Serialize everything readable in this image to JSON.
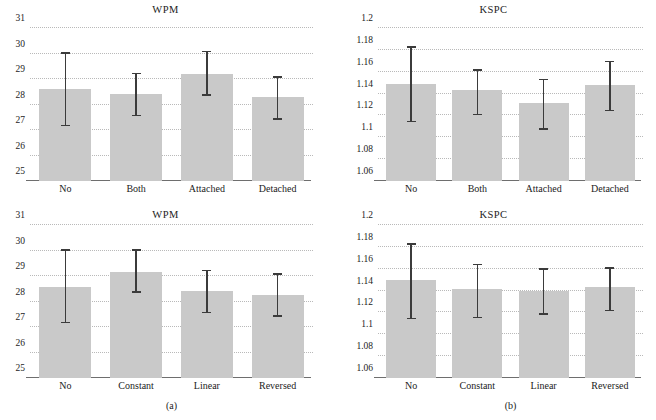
{
  "figure": {
    "background": "#ffffff",
    "bar_color": "#c9c9c9",
    "error_color": "#3b3b3b",
    "grid_color": "#b9b9b9",
    "axis_color": "#6e6e6e",
    "subcaptions": {
      "left": "(a)",
      "right": "(b)"
    }
  },
  "chart_data": [
    {
      "id": "wpm-top",
      "type": "bar",
      "title": "WPM",
      "xlabel": "",
      "ylabel": "",
      "categories": [
        "No",
        "Both",
        "Attached",
        "Detached"
      ],
      "values": [
        28.6,
        28.4,
        29.2,
        28.3
      ],
      "error_low": [
        27.15,
        27.55,
        28.35,
        27.4
      ],
      "error_high": [
        30.0,
        29.2,
        30.05,
        29.05
      ],
      "ylim": [
        25,
        31
      ],
      "yticks": [
        "25",
        "26",
        "27",
        "28",
        "29",
        "30",
        "31"
      ],
      "ytick_values": [
        25,
        26,
        27,
        28,
        29,
        30,
        31
      ],
      "grid": true,
      "legend": "none"
    },
    {
      "id": "kspc-top",
      "type": "bar",
      "title": "KSPC",
      "xlabel": "",
      "ylabel": "",
      "categories": [
        "No",
        "Both",
        "Attached",
        "Detached"
      ],
      "values": [
        1.149,
        1.143,
        1.131,
        1.148
      ],
      "error_low": [
        1.114,
        1.12,
        1.107,
        1.124
      ],
      "error_high": [
        1.182,
        1.161,
        1.152,
        1.169
      ],
      "ylim": [
        1.06,
        1.2
      ],
      "yticks": [
        "1.06",
        "1.08",
        "1.1",
        "1.12",
        "1.14",
        "1.16",
        "1.18",
        "1.2"
      ],
      "ytick_values": [
        1.06,
        1.08,
        1.1,
        1.12,
        1.14,
        1.16,
        1.18,
        1.2
      ],
      "grid": true,
      "legend": "none"
    },
    {
      "id": "wpm-bot",
      "type": "bar",
      "title": "WPM",
      "xlabel": "",
      "ylabel": "",
      "categories": [
        "No",
        "Constant",
        "Linear",
        "Reversed"
      ],
      "values": [
        28.58,
        29.15,
        28.43,
        28.25
      ],
      "error_low": [
        27.15,
        28.35,
        27.55,
        27.4
      ],
      "error_high": [
        30.0,
        30.0,
        29.2,
        29.05
      ],
      "ylim": [
        25,
        31
      ],
      "yticks": [
        "25",
        "26",
        "27",
        "28",
        "29",
        "30",
        "31"
      ],
      "ytick_values": [
        25,
        26,
        27,
        28,
        29,
        30,
        31
      ],
      "grid": true,
      "legend": "none"
    },
    {
      "id": "kspc-bot",
      "type": "bar",
      "title": "KSPC",
      "xlabel": "",
      "ylabel": "",
      "categories": [
        "No",
        "Constant",
        "Linear",
        "Reversed"
      ],
      "values": [
        1.15,
        1.141,
        1.14,
        1.143
      ],
      "error_low": [
        1.114,
        1.115,
        1.118,
        1.121
      ],
      "error_high": [
        1.182,
        1.163,
        1.159,
        1.16
      ],
      "ylim": [
        1.06,
        1.2
      ],
      "yticks": [
        "1.06",
        "1.08",
        "1.1",
        "1.12",
        "1.14",
        "1.16",
        "1.18",
        "1.2"
      ],
      "ytick_values": [
        1.06,
        1.08,
        1.1,
        1.12,
        1.14,
        1.16,
        1.18,
        1.2
      ],
      "grid": true,
      "legend": "none"
    }
  ]
}
